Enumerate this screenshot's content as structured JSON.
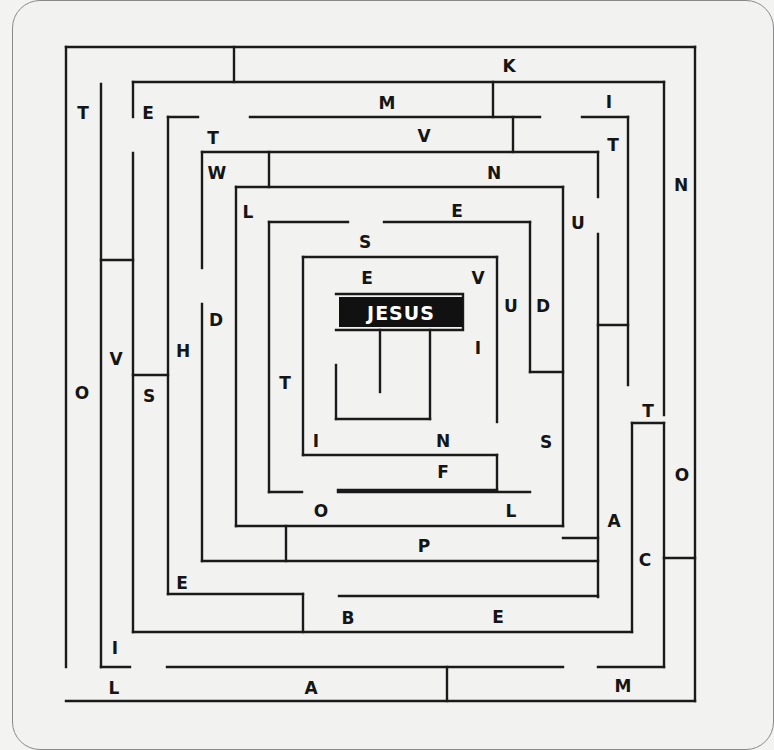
{
  "puzzle": {
    "type": "letter maze",
    "goal_label": "JESUS",
    "colors": {
      "background": "#f2f2f0",
      "walls": "#1a1a1a",
      "goal_box": "#111111",
      "goal_text": "#ffffff",
      "card_border": "#8a8a8a"
    }
  },
  "goal": {
    "x": 339,
    "y": 297,
    "w": 124,
    "h": 30,
    "label": "JESUS",
    "frame": [
      [
        336,
        294
      ],
      [
        463,
        294
      ],
      [
        463,
        330
      ],
      [
        336,
        330
      ]
    ]
  },
  "letters": [
    {
      "ch": "T",
      "x": 83,
      "y": 113
    },
    {
      "ch": "E",
      "x": 148,
      "y": 113
    },
    {
      "ch": "K",
      "x": 509,
      "y": 66
    },
    {
      "ch": "M",
      "x": 387,
      "y": 103
    },
    {
      "ch": "I",
      "x": 609,
      "y": 102
    },
    {
      "ch": "T",
      "x": 213,
      "y": 138
    },
    {
      "ch": "V",
      "x": 424,
      "y": 136
    },
    {
      "ch": "T",
      "x": 613,
      "y": 145
    },
    {
      "ch": "W",
      "x": 217,
      "y": 173
    },
    {
      "ch": "N",
      "x": 494,
      "y": 173
    },
    {
      "ch": "N",
      "x": 681,
      "y": 185
    },
    {
      "ch": "L",
      "x": 248,
      "y": 212
    },
    {
      "ch": "E",
      "x": 457,
      "y": 211
    },
    {
      "ch": "U",
      "x": 578,
      "y": 223
    },
    {
      "ch": "S",
      "x": 365,
      "y": 242
    },
    {
      "ch": "E",
      "x": 367,
      "y": 278
    },
    {
      "ch": "V",
      "x": 478,
      "y": 278
    },
    {
      "ch": "U",
      "x": 511,
      "y": 306
    },
    {
      "ch": "D",
      "x": 543,
      "y": 306
    },
    {
      "ch": "D",
      "x": 216,
      "y": 320
    },
    {
      "ch": "I",
      "x": 478,
      "y": 348
    },
    {
      "ch": "H",
      "x": 183,
      "y": 351
    },
    {
      "ch": "V",
      "x": 116,
      "y": 359
    },
    {
      "ch": "O",
      "x": 82,
      "y": 393
    },
    {
      "ch": "S",
      "x": 149,
      "y": 396
    },
    {
      "ch": "T",
      "x": 285,
      "y": 383
    },
    {
      "ch": "T",
      "x": 648,
      "y": 411
    },
    {
      "ch": "I",
      "x": 316,
      "y": 441
    },
    {
      "ch": "N",
      "x": 443,
      "y": 441
    },
    {
      "ch": "S",
      "x": 546,
      "y": 442
    },
    {
      "ch": "F",
      "x": 443,
      "y": 472
    },
    {
      "ch": "O",
      "x": 682,
      "y": 475
    },
    {
      "ch": "O",
      "x": 321,
      "y": 511
    },
    {
      "ch": "L",
      "x": 511,
      "y": 511
    },
    {
      "ch": "A",
      "x": 614,
      "y": 521
    },
    {
      "ch": "P",
      "x": 424,
      "y": 546
    },
    {
      "ch": "C",
      "x": 645,
      "y": 560
    },
    {
      "ch": "E",
      "x": 182,
      "y": 583
    },
    {
      "ch": "B",
      "x": 348,
      "y": 618
    },
    {
      "ch": "E",
      "x": 498,
      "y": 617
    },
    {
      "ch": "I",
      "x": 115,
      "y": 648
    },
    {
      "ch": "L",
      "x": 114,
      "y": 688
    },
    {
      "ch": "A",
      "x": 311,
      "y": 688
    },
    {
      "ch": "M",
      "x": 623,
      "y": 686
    }
  ],
  "walls": [
    [
      66,
      47,
      695,
      47
    ],
    [
      66,
      47,
      66,
      667
    ],
    [
      695,
      47,
      695,
      701
    ],
    [
      66,
      701,
      695,
      701
    ],
    [
      234,
      47,
      234,
      82
    ],
    [
      101,
      84,
      101,
      667
    ],
    [
      101,
      667,
      130,
      667
    ],
    [
      167,
      667,
      563,
      667
    ],
    [
      598,
      667,
      664,
      667
    ],
    [
      447,
      667,
      447,
      701
    ],
    [
      133,
      82,
      664,
      82
    ],
    [
      133,
      82,
      133,
      117
    ],
    [
      133,
      153,
      133,
      632
    ],
    [
      664,
      82,
      664,
      415
    ],
    [
      493,
      82,
      493,
      117
    ],
    [
      168,
      117,
      198,
      117
    ],
    [
      250,
      117,
      540,
      117
    ],
    [
      582,
      117,
      628,
      117
    ],
    [
      628,
      117,
      628,
      385
    ],
    [
      513,
      117,
      513,
      152
    ],
    [
      168,
      117,
      168,
      594
    ],
    [
      202,
      152,
      598,
      152
    ],
    [
      202,
      152,
      202,
      268
    ],
    [
      202,
      304,
      202,
      561
    ],
    [
      598,
      152,
      598,
      197
    ],
    [
      598,
      234,
      598,
      597
    ],
    [
      269,
      152,
      269,
      187
    ],
    [
      236,
      187,
      563,
      187
    ],
    [
      236,
      187,
      236,
      526
    ],
    [
      563,
      187,
      563,
      526
    ],
    [
      269,
      222,
      348,
      222
    ],
    [
      384,
      222,
      530,
      222
    ],
    [
      530,
      222,
      530,
      372
    ],
    [
      269,
      222,
      269,
      492
    ],
    [
      269,
      492,
      302,
      492
    ],
    [
      338,
      492,
      530,
      492
    ],
    [
      530,
      372,
      563,
      372
    ],
    [
      303,
      257,
      497,
      257
    ],
    [
      303,
      257,
      303,
      455
    ],
    [
      303,
      455,
      497,
      455
    ],
    [
      497,
      257,
      497,
      422
    ],
    [
      497,
      455,
      497,
      490
    ],
    [
      497,
      490,
      338,
      490
    ],
    [
      430,
      330,
      430,
      419
    ],
    [
      336,
      419,
      430,
      419
    ],
    [
      336,
      365,
      336,
      419
    ],
    [
      380,
      330,
      380,
      392
    ],
    [
      236,
      526,
      563,
      526
    ],
    [
      286,
      526,
      286,
      561
    ],
    [
      202,
      561,
      598,
      561
    ],
    [
      563,
      538,
      598,
      538
    ],
    [
      101,
      260,
      133,
      260
    ],
    [
      133,
      375,
      168,
      375
    ],
    [
      598,
      325,
      628,
      325
    ],
    [
      168,
      594,
      303,
      594
    ],
    [
      303,
      594,
      303,
      632
    ],
    [
      339,
      596,
      598,
      596
    ],
    [
      133,
      632,
      632,
      632
    ],
    [
      632,
      423,
      632,
      632
    ],
    [
      632,
      423,
      664,
      423
    ],
    [
      664,
      423,
      664,
      667
    ],
    [
      664,
      558,
      695,
      558
    ]
  ]
}
